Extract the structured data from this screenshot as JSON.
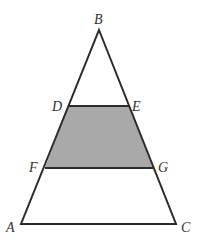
{
  "diagram": {
    "type": "geometry-triangle",
    "colors": {
      "stroke": "#2b2b2b",
      "shade": "#a9a9a9",
      "label": "#333333"
    },
    "points": [
      {
        "id": "B",
        "label": "B"
      },
      {
        "id": "D",
        "label": "D"
      },
      {
        "id": "E",
        "label": "E"
      },
      {
        "id": "F",
        "label": "F"
      },
      {
        "id": "G",
        "label": "G"
      },
      {
        "id": "A",
        "label": "A"
      },
      {
        "id": "C",
        "label": "C"
      }
    ]
  }
}
